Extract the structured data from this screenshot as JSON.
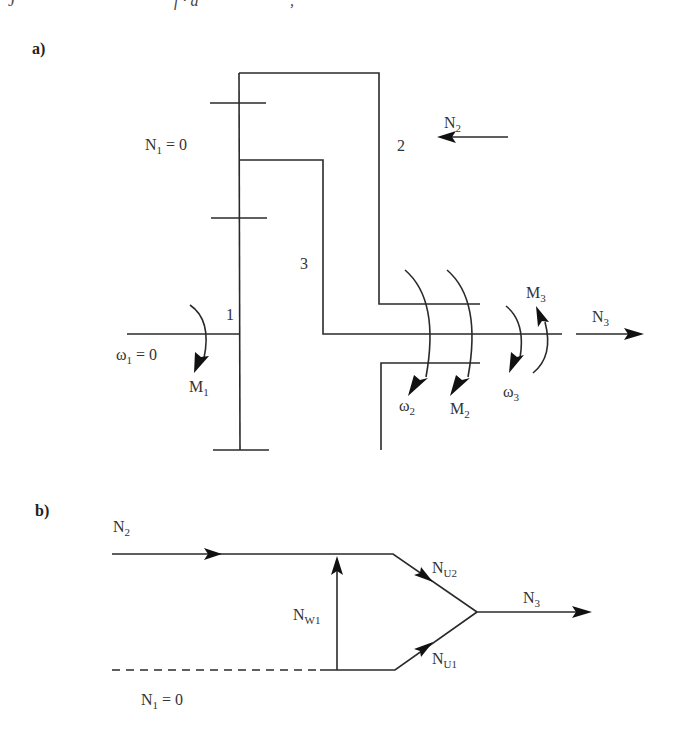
{
  "top_fragment": {
    "left": "J",
    "mid": "f · a",
    "right": ","
  },
  "panel_a": {
    "label": "a)",
    "labels": {
      "n1": {
        "base": "N",
        "sub": "1",
        "rest": " = 0"
      },
      "part2": "2",
      "part3": "3",
      "part1": "1",
      "n2": {
        "base": "N",
        "sub": "2"
      },
      "omega1": {
        "base": "ω",
        "sub": "1",
        "rest": " = 0"
      },
      "m1": {
        "base": "M",
        "sub": "1"
      },
      "omega2": {
        "base": "ω",
        "sub": "2"
      },
      "m2": {
        "base": "M",
        "sub": "2"
      },
      "omega3": {
        "base": "ω",
        "sub": "3"
      },
      "m3": {
        "base": "M",
        "sub": "3"
      },
      "n3": {
        "base": "N",
        "sub": "3"
      }
    }
  },
  "panel_b": {
    "label": "b)",
    "labels": {
      "n2": {
        "base": "N",
        "sub": "2"
      },
      "nw1": {
        "base": "N",
        "sub": "W1"
      },
      "nu2": {
        "base": "N",
        "sub": "U2"
      },
      "nu1": {
        "base": "N",
        "sub": "U1"
      },
      "n3": {
        "base": "N",
        "sub": "3"
      },
      "n1": {
        "base": "N",
        "sub": "1",
        "rest": " = 0"
      }
    }
  }
}
